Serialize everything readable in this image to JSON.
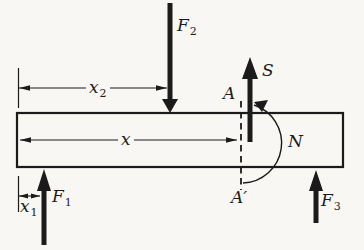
{
  "colors": {
    "ink": "#1b1b1b",
    "paper": "#f8f7f3"
  },
  "labels": {
    "F1": {
      "base": "F",
      "sub": "1"
    },
    "F2": {
      "base": "F",
      "sub": "2"
    },
    "F3": {
      "base": "F",
      "sub": "3"
    },
    "x1": {
      "base": "x",
      "sub": "1"
    },
    "x2": {
      "base": "x",
      "sub": "2"
    },
    "x": "x",
    "S": "S",
    "N": "N",
    "A": "A",
    "A_prime": "A′"
  }
}
